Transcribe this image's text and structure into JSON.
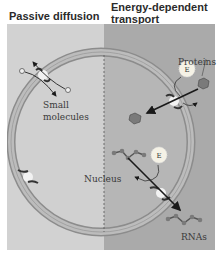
{
  "diagram": {
    "headers": {
      "left": "Passive diffusion",
      "right_line1": "Energy-dependent",
      "right_line2": "transport"
    },
    "labels": {
      "small_molecules_1": "Small",
      "small_molecules_2": "molecules",
      "proteins": "Proteins",
      "nucleus": "Nucleus",
      "rnas": "RNAs",
      "energy_1": "E",
      "energy_2": "E"
    },
    "colors": {
      "left_panel": "#d2d2d2",
      "right_panel": "#aaaaaa",
      "membrane": "#b5b5b5",
      "membrane_edge": "#8c8c8c",
      "arrow": "#1a1a1a",
      "energy_burst": "#f5f2e6"
    }
  }
}
